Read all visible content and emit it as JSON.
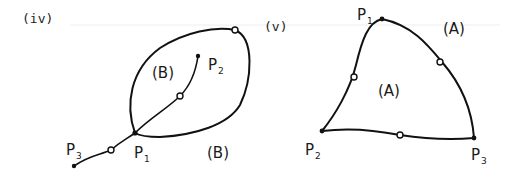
{
  "figure": {
    "panels": [
      {
        "id": "iv",
        "label": "(iv)",
        "region_labels": [
          "(B)",
          "(B)"
        ],
        "points": [
          {
            "name": "P",
            "sub": "1"
          },
          {
            "name": "P",
            "sub": "2"
          },
          {
            "name": "P",
            "sub": "3"
          }
        ]
      },
      {
        "id": "v",
        "label": "(v)",
        "region_labels": [
          "(A)",
          "(A)"
        ],
        "points": [
          {
            "name": "P",
            "sub": "1"
          },
          {
            "name": "P",
            "sub": "2"
          },
          {
            "name": "P",
            "sub": "3"
          }
        ]
      }
    ],
    "colors": {
      "ink": "#111111",
      "hatch": "#333333",
      "background": "#ffffff"
    }
  }
}
